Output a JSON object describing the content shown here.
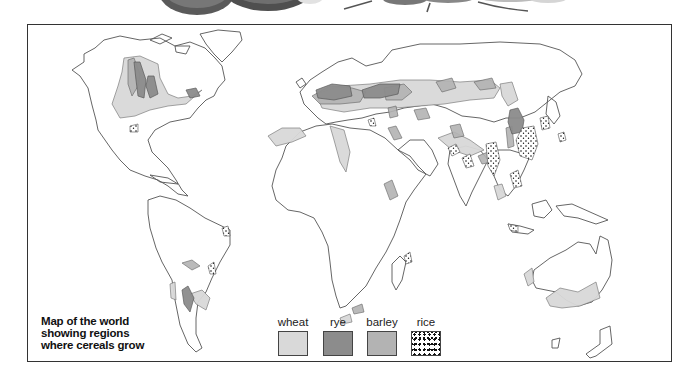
{
  "caption": {
    "lines": [
      "Map of the world",
      "showing regions",
      "where cereals grow"
    ]
  },
  "legend": {
    "items": [
      {
        "label": "wheat",
        "color": "#d9d9d9",
        "pattern": "solid-light-grey"
      },
      {
        "label": "rye",
        "color": "#8c8c8c",
        "pattern": "solid-dark-grey"
      },
      {
        "label": "barley",
        "color": "#b3b3b3",
        "pattern": "solid-medium-grey"
      },
      {
        "label": "rice",
        "color": "#111111",
        "pattern": "dotted-stipple"
      }
    ]
  },
  "colors": {
    "outline": "#555555",
    "wheat": "#d9d9d9",
    "rye": "#8c8c8c",
    "barley": "#b3b3b3",
    "rice_dots": "#111111",
    "frame": "#333333"
  }
}
